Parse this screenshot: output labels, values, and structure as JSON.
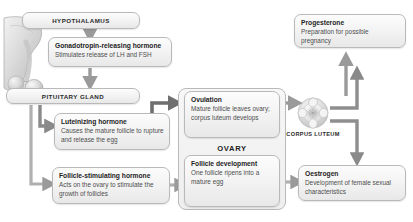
{
  "diagram": {
    "title_hidden": "Hormonal control of the menstrual cycle",
    "accent_box_border": "#b9b9b9",
    "arrow_color": "#8a8a8a",
    "arrow_color_dark": "#6f6f6f",
    "text_color": "#1d1d1d",
    "body_text_color": "#4e4e4e"
  },
  "nodes": {
    "hypothalamus": {
      "label": "HYPOTHALAMUS"
    },
    "gnrh": {
      "title": "Gonadotropin-releasing hormone",
      "body": "Stimulates release of LH and FSH"
    },
    "pituitary": {
      "label": "PITUITARY GLAND"
    },
    "lh": {
      "title": "Luteinizing hormone",
      "body": "Causes the mature follicle to rupture and release the egg"
    },
    "fsh": {
      "title": "Follicle-stimulating hormone",
      "body": "Acts on the ovary to stimulate the growth of follicles"
    },
    "ovary": {
      "label": "OVARY"
    },
    "ovulation": {
      "title": "Ovulation",
      "body": "Mature follicle leaves ovary; corpus luteum develops"
    },
    "follicle_development": {
      "title": "Follicle development",
      "body": "One follicle ripens into a mature egg"
    },
    "corpus_luteum": {
      "label": "CORPUS LUTEUM"
    },
    "progesterone": {
      "title": "Progesterone",
      "body": "Preparation for possible pregnancy"
    },
    "oestrogen": {
      "title": "Oestrogen",
      "body": "Development of female sexual characteristics"
    }
  },
  "illustrations": {
    "hypothalamus_pituitary": "hypothalamus-pituitary-anatomy-illustration",
    "corpus_luteum": "corpus-luteum-illustration"
  },
  "connections": [
    {
      "from": "hypothalamus",
      "to": "gnrh"
    },
    {
      "from": "gnrh",
      "to": "pituitary"
    },
    {
      "from": "pituitary",
      "to": "lh"
    },
    {
      "from": "pituitary",
      "to": "fsh"
    },
    {
      "from": "lh",
      "to": "ovulation"
    },
    {
      "from": "fsh",
      "to": "follicle_development"
    },
    {
      "from": "follicle_development",
      "to": "ovulation"
    },
    {
      "from": "ovulation",
      "to": "corpus_luteum"
    },
    {
      "from": "corpus_luteum",
      "to": "progesterone"
    },
    {
      "from": "corpus_luteum",
      "to": "oestrogen"
    },
    {
      "from": "follicle_development",
      "to": "oestrogen"
    },
    {
      "from": "progesterone",
      "to": "hypothalamus_feedback"
    }
  ]
}
